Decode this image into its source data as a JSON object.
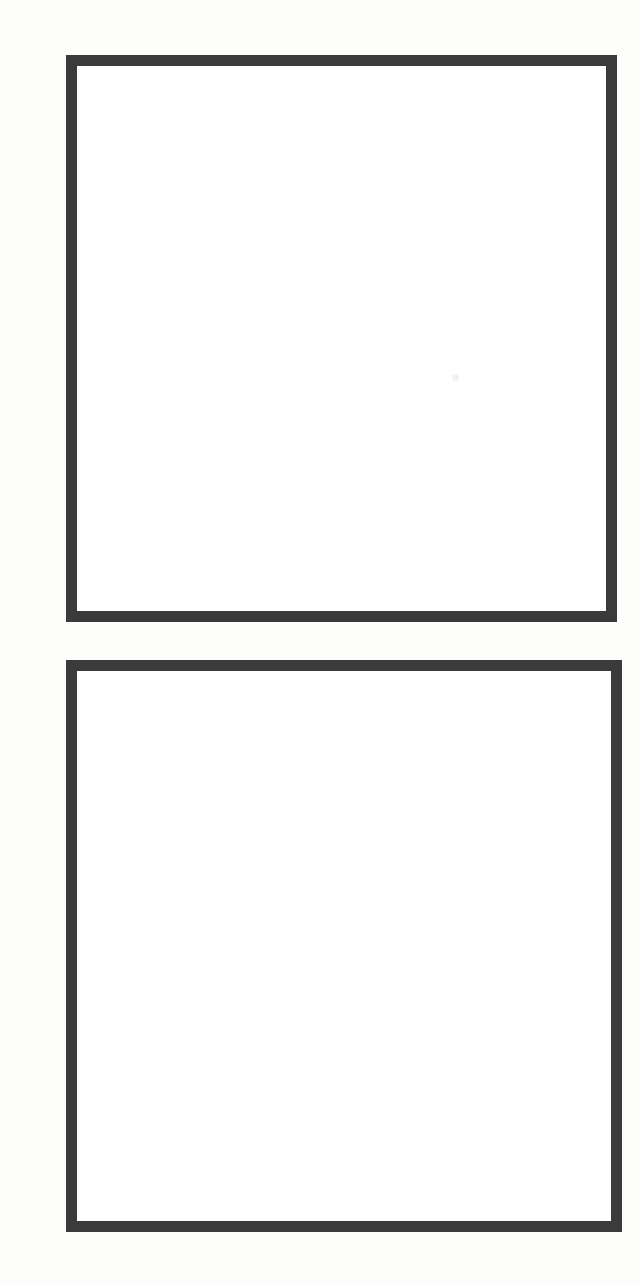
{
  "page": {
    "kind": "scanned-document-page",
    "width": 639,
    "height": 1285,
    "background_color": "#fdfdfc",
    "paper_color": "#ffffff",
    "visible_text": "",
    "caption": ""
  },
  "frames": [
    {
      "name": "upper-empty-frame",
      "label": "",
      "content": "",
      "border_color": "#3b3b3b",
      "fill_color": "#ffffff",
      "border_width_px": 11,
      "x": 66,
      "y": 55,
      "width": 551,
      "height": 567
    },
    {
      "name": "lower-empty-frame",
      "label": "",
      "content": "",
      "border_color": "#3b3b3b",
      "fill_color": "#ffffff",
      "border_width_px": 11,
      "x": 66,
      "y": 660,
      "width": 556,
      "height": 572
    }
  ],
  "artifacts": [
    {
      "name": "dust-speck",
      "color": "#f2f2f2",
      "x": 452,
      "y": 374,
      "size": 7
    }
  ]
}
